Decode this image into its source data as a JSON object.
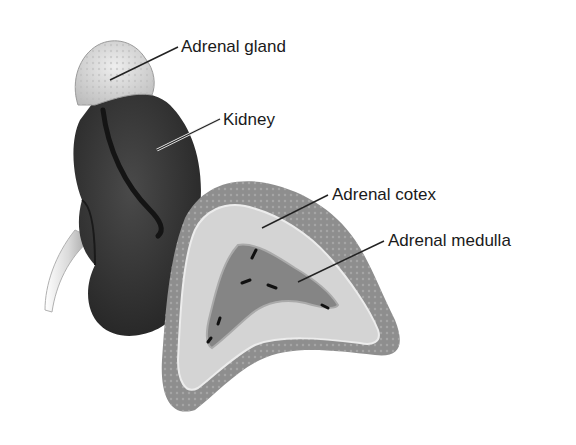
{
  "diagram": {
    "labels": [
      {
        "id": "adrenal-gland",
        "text": "Adrenal gland",
        "x": 181,
        "y": 38
      },
      {
        "id": "kidney",
        "text": "Kidney",
        "x": 223,
        "y": 111
      },
      {
        "id": "adrenal-cortex",
        "text": "Adrenal cotex",
        "x": 332,
        "y": 186
      },
      {
        "id": "adrenal-medulla",
        "text": "Adrenal medulla",
        "x": 388,
        "y": 232
      }
    ],
    "colors": {
      "kidney": "#3a3a3a",
      "gland_surface": "#dcdcdc",
      "cortex_outer": "#8e8e8e",
      "cortex_inner": "#d2d2d2",
      "medulla": "#7a7a7a",
      "ureter": "#e6e6e6",
      "leader_line": "#222222"
    }
  }
}
